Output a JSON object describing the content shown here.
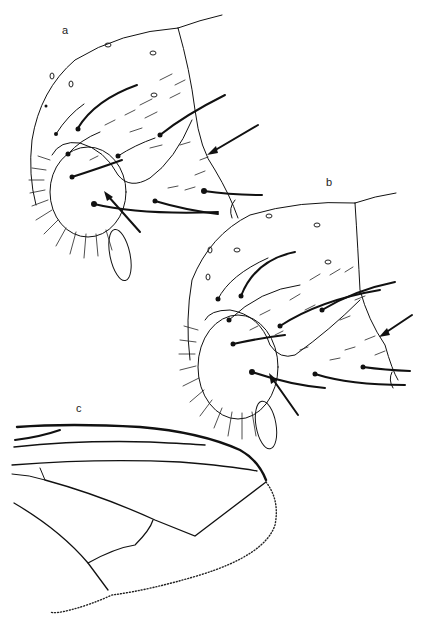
{
  "figure": {
    "panels": [
      {
        "id": "a",
        "label": "a",
        "subject": "thorax lateral view with arrows"
      },
      {
        "id": "b",
        "label": "b",
        "subject": "thorax lateral view with arrows"
      },
      {
        "id": "c",
        "label": "c",
        "subject": "wing venation"
      }
    ],
    "colors": {
      "ink": "#111111",
      "background": "#ffffff"
    }
  }
}
